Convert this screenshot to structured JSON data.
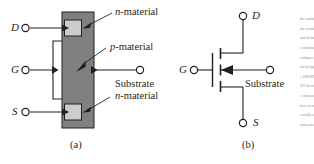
{
  "figure": {
    "caption_a": "(a)",
    "caption_b": "(b)",
    "colors": {
      "p_material_fill": "#808080",
      "n_material_fill": "#cccccc",
      "outline": "#231f20",
      "label_text": "#231f20"
    }
  },
  "structure_diagram": {
    "terminals": {
      "drain": "D",
      "gate": "G",
      "source": "S",
      "substrate": "Substrate"
    },
    "annotations": {
      "n_material_top_prefix": "n",
      "n_material_top_suffix": "-material",
      "p_material_prefix": "p",
      "p_material_suffix": "-material",
      "n_material_bottom_prefix": "n",
      "n_material_bottom_suffix": "-material"
    }
  },
  "symbol_diagram": {
    "terminals": {
      "drain": "D",
      "gate": "G",
      "source": "S",
      "substrate": "Substrate"
    }
  },
  "page_margin_text": {
    "fragment": "the substrate terminal of the n channel enhancement type MOSFET device shown here is internally connected to the source"
  }
}
